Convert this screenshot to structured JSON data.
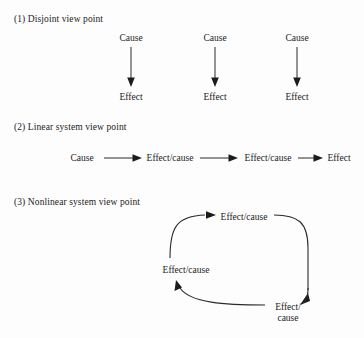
{
  "figure": {
    "background_color": "#fdfdfd",
    "line_color": "#2b2b2b",
    "text_color": "#1b1b1b"
  },
  "sections": {
    "disjoint": {
      "heading": "(1) Disjoint view point",
      "pairs": [
        {
          "cause": "Cause",
          "effect": "Effect"
        },
        {
          "cause": "Cause",
          "effect": "Effect"
        },
        {
          "cause": "Cause",
          "effect": "Effect"
        }
      ]
    },
    "linear": {
      "heading": "(2) Linear system view point",
      "chain": [
        "Cause",
        "Effect/cause",
        "Effect/cause",
        "Effect"
      ]
    },
    "nonlinear": {
      "heading": "(3) Nonlinear system view point",
      "cycle": {
        "top": "Effect/cause",
        "left": "Effect/cause",
        "bottom_right_line1": "Effect/",
        "bottom_right_line2": "cause"
      }
    }
  }
}
